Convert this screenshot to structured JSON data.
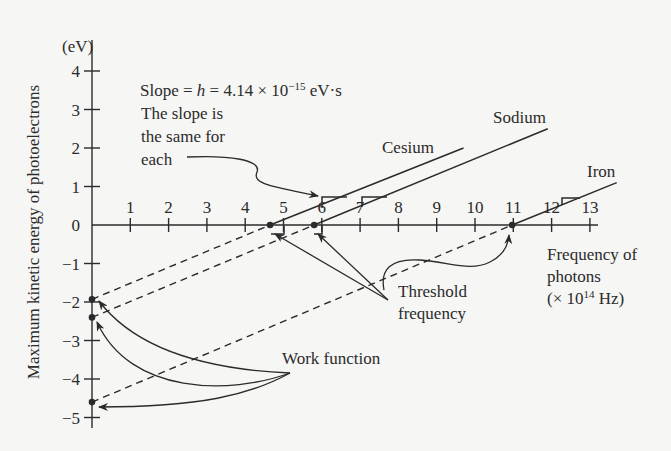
{
  "chart_data": {
    "type": "line",
    "title": "",
    "xlabel": "Frequency of photons (× 10^14 Hz)",
    "ylabel": "Maximum kinetic energy of photoelectrons",
    "y_unit": "(eV)",
    "xlim": [
      0,
      13
    ],
    "ylim": [
      -5,
      4
    ],
    "x_ticks": [
      1,
      2,
      3,
      4,
      5,
      6,
      7,
      8,
      9,
      10,
      11,
      12,
      13
    ],
    "y_ticks": [
      4,
      3,
      2,
      1,
      0,
      -1,
      -2,
      -3,
      -4,
      -5
    ],
    "grid": false,
    "slope_eV_per_1e14Hz": 0.414,
    "series": [
      {
        "name": "Cesium",
        "threshold_frequency": 4.65,
        "work_function": -1.93,
        "x": [
          4.65,
          9.7
        ],
        "y": [
          0,
          2.0
        ],
        "label_pos": [
          5.8,
          2.3
        ]
      },
      {
        "name": "Sodium",
        "threshold_frequency": 5.8,
        "work_function": -2.4,
        "x": [
          5.8,
          11.9
        ],
        "y": [
          0,
          2.5
        ],
        "label_pos": [
          10.2,
          2.85
        ]
      },
      {
        "name": "Iron",
        "threshold_frequency": 10.97,
        "work_function": -4.6,
        "x": [
          10.97,
          13.7
        ],
        "y": [
          0,
          1.1
        ],
        "label_pos": [
          12.6,
          1.45
        ]
      }
    ],
    "annotations": [
      {
        "text": "Slope = h = 4.14 × 10^−15 eV·s"
      },
      {
        "text": "The slope is the same for each"
      },
      {
        "text": "Threshold frequency"
      },
      {
        "text": "Work function"
      }
    ]
  },
  "labels": {
    "y_unit": "(eV)",
    "y_title": "Maximum kinetic energy of photoelectrons",
    "x_title_line1": "Frequency of",
    "x_title_line2": "photons",
    "x_title_line3_pre": "(× 10",
    "x_title_line3_sup": "14",
    "x_title_line3_post": " Hz)",
    "slope_pre": "Slope = ",
    "slope_h": "h",
    "slope_mid": " = 4.14 × 10",
    "slope_sup": "−15",
    "slope_post": " eV·s",
    "slope_note_1": "The slope is",
    "slope_note_2": "the same for",
    "slope_note_3": "each",
    "threshold_1": "Threshold",
    "threshold_2": "frequency",
    "work_function": "Work function",
    "cesium": "Cesium",
    "sodium": "Sodium",
    "iron": "Iron"
  }
}
